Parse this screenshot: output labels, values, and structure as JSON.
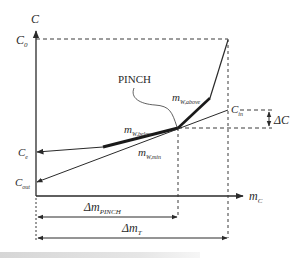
{
  "diagram": {
    "type": "water-pinch concentration vs. flowrate diagram",
    "axes": {
      "y_label": "C",
      "x_label_main": "m",
      "x_label_sub": "C"
    },
    "y_levels": {
      "c0": {
        "main": "C",
        "sub": "0"
      },
      "cin": {
        "main": "C",
        "sub": "in"
      },
      "ce": {
        "main": "C",
        "sub": "e"
      },
      "cout": {
        "main": "C",
        "sub": "out"
      }
    },
    "annotations": {
      "pinch": "PINCH",
      "delta_c": "ΔC",
      "mw_above": {
        "main": "m",
        "sub": "W,above"
      },
      "mw_below": {
        "main": "m",
        "sub": "W,below"
      },
      "mw_min": {
        "main": "m",
        "sub": "W,min"
      }
    },
    "dimensions": {
      "delta_m_pinch": {
        "main": "Δm",
        "sub": "PINCH"
      },
      "delta_m_t": {
        "main": "Δm",
        "sub": "T"
      }
    },
    "colors": {
      "line": "#2a2a2a",
      "dashed": "#3a3a3a",
      "background": "#ffffff"
    }
  }
}
